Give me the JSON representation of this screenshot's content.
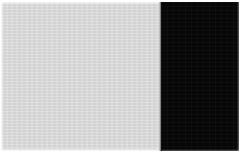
{
  "canvas": {
    "width": 240,
    "height": 155,
    "background_color": "#ffffff",
    "description": "Two-tone rectangular panel: a large light gray field on the left and a near-black field on the right, separated by a hard vertical edge."
  },
  "content_area": {
    "x": 1,
    "y": 2,
    "width": 238,
    "height": 149
  },
  "panels": [
    {
      "id": "light-panel",
      "label": "Light gray field",
      "color": "#d7d8d7",
      "x": 1,
      "y": 2,
      "width": 160,
      "height": 149,
      "texture": "fine compression noise"
    },
    {
      "id": "dark-panel",
      "label": "Near-black field",
      "color": "#070707",
      "x": 161,
      "y": 2,
      "width": 78,
      "height": 149,
      "texture": "faint compression noise"
    }
  ],
  "boundary": {
    "label": "Vertical tone boundary",
    "orientation": "vertical",
    "x": 160,
    "transition_width": 2
  },
  "margins": {
    "top": 2,
    "left": 1,
    "right": 1,
    "bottom": 4,
    "color": "#ffffff"
  }
}
